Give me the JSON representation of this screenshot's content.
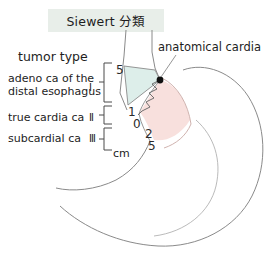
{
  "figure": {
    "title": "Siewert 分類",
    "title_background": "#e8eee9",
    "background": "#ffffff",
    "width": 278,
    "height": 263
  },
  "legend": {
    "heading": "tumor type",
    "entries": [
      {
        "name": "adeno ca of the distal esophagus",
        "line1": "adeno ca of the",
        "line2": "distal esophagus",
        "numeral": "Ⅰ"
      },
      {
        "name": "true cardia ca",
        "line1": "true cardia ca",
        "line2": "",
        "numeral": "Ⅱ"
      },
      {
        "name": "subcardial ca",
        "line1": "subcardial ca",
        "line2": "",
        "numeral": "Ⅲ"
      }
    ]
  },
  "scale": {
    "unit": "cm",
    "ticks": [
      {
        "label": "5",
        "position": "upper-esophageal"
      },
      {
        "label": "1",
        "position": "above-cardia"
      },
      {
        "label": "0",
        "position": "cardia"
      },
      {
        "label": "2",
        "position": "below-cardia"
      },
      {
        "label": "5",
        "position": "lower-gastric"
      }
    ]
  },
  "annotations": {
    "anatomical_cardia": "anatomical cardia"
  },
  "colors": {
    "esophageal_zone": "#ddeeea",
    "gastric_zone": "#f8e0dd",
    "outline": "#8a8a8a",
    "text": "#1d1d1d",
    "marker": "#111111"
  }
}
